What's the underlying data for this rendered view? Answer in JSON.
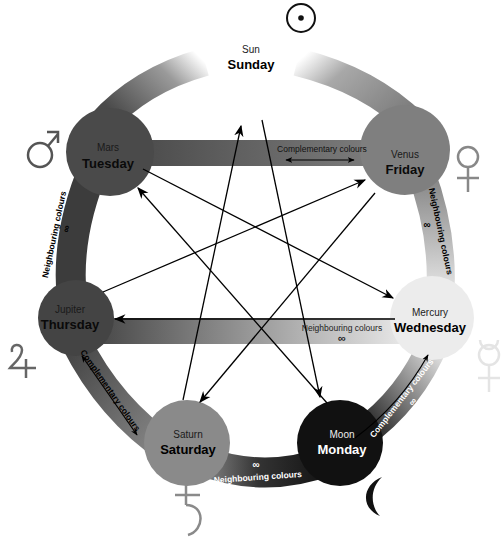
{
  "nodes": [
    {
      "id": "sun",
      "planet": "Sun",
      "day": "Sunday",
      "symbol": "sun-symbol",
      "color": "#ffffff"
    },
    {
      "id": "moon",
      "planet": "Moon",
      "day": "Monday",
      "symbol": "moon-symbol",
      "color": "#111111"
    },
    {
      "id": "mars",
      "planet": "Mars",
      "day": "Tuesday",
      "symbol": "mars-symbol",
      "color": "#4a4a4a"
    },
    {
      "id": "mercury",
      "planet": "Mercury",
      "day": "Wednesday",
      "symbol": "mercury-symbol",
      "color": "#ececec"
    },
    {
      "id": "jupiter",
      "planet": "Jupiter",
      "day": "Thursday",
      "symbol": "jupiter-symbol",
      "color": "#444444"
    },
    {
      "id": "venus",
      "planet": "Venus",
      "day": "Friday",
      "symbol": "venus-symbol",
      "color": "#7f7f7f"
    },
    {
      "id": "saturn",
      "planet": "Saturn",
      "day": "Saturday",
      "symbol": "saturn-symbol",
      "color": "#8a8a8a"
    }
  ],
  "bands": {
    "mars_venus": {
      "label": "Complementary colours",
      "marker": "double-arrow"
    },
    "mars_jupiter": {
      "label": "Neighbouring colours",
      "marker": "∞"
    },
    "venus_mercury": {
      "label": "Neighbouring colours",
      "marker": "∞"
    },
    "jupiter_mercury": {
      "label": "Neighbouring colours",
      "marker": "∞"
    },
    "jupiter_saturn": {
      "label": "Complementary colours",
      "marker": "double-arrow"
    },
    "saturn_moon": {
      "label": "Neighbouring colours",
      "marker": "∞"
    },
    "moon_mercury": {
      "label": "Complementary colours",
      "marker": "∞"
    }
  },
  "heptagram_sequence": [
    "Sunday",
    "Monday",
    "Tuesday",
    "Wednesday",
    "Thursday",
    "Friday",
    "Saturday",
    "Sunday"
  ]
}
